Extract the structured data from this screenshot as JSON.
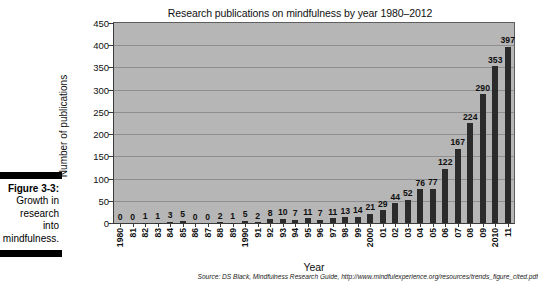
{
  "caption": {
    "figure_number": "Figure 3-3:",
    "lines": [
      "Growth in",
      "research",
      "into",
      "mindfulness."
    ]
  },
  "chart_data": {
    "type": "bar",
    "title": "Research publications on mindfulness by year 1980–2012",
    "xlabel": "Year",
    "ylabel": "Number of publications",
    "ylim": [
      0,
      450
    ],
    "yticks": [
      0,
      50,
      100,
      150,
      200,
      250,
      300,
      350,
      400,
      450
    ],
    "ytick_labels": [
      "0",
      "50",
      "100",
      "150",
      "200",
      "250",
      "300",
      "350",
      "400",
      "450"
    ],
    "grid": true,
    "legend": "none",
    "bar_color": "#2b2b2b",
    "plot_background": "#b6b6b6",
    "categories": [
      "1980",
      "81",
      "82",
      "83",
      "84",
      "85",
      "86",
      "87",
      "88",
      "89",
      "1990",
      "91",
      "92",
      "93",
      "94",
      "95",
      "96",
      "97",
      "98",
      "99",
      "2000",
      "01",
      "02",
      "03",
      "04",
      "05",
      "06",
      "07",
      "08",
      "09",
      "2010",
      "11"
    ],
    "values": [
      0,
      0,
      1,
      1,
      3,
      5,
      0,
      0,
      2,
      1,
      5,
      2,
      8,
      10,
      7,
      11,
      7,
      11,
      13,
      14,
      21,
      29,
      44,
      52,
      76,
      77,
      122,
      167,
      224,
      290,
      353,
      397
    ],
    "data_labels": [
      "0",
      "0",
      "1",
      "1",
      "3",
      "5",
      "0",
      "0",
      "2",
      "1",
      "5",
      "2",
      "8",
      "10",
      "7",
      "11",
      "7",
      "11",
      "13",
      "14",
      "21",
      "29",
      "44",
      "52",
      "76",
      "77",
      "122",
      "167",
      "224",
      "290",
      "353",
      "397"
    ],
    "annotation": "Source: DS Black, Mindfulness Research Guide, http://www.mindfulexperience.org/resources/trends_figure_cited.pdf"
  }
}
